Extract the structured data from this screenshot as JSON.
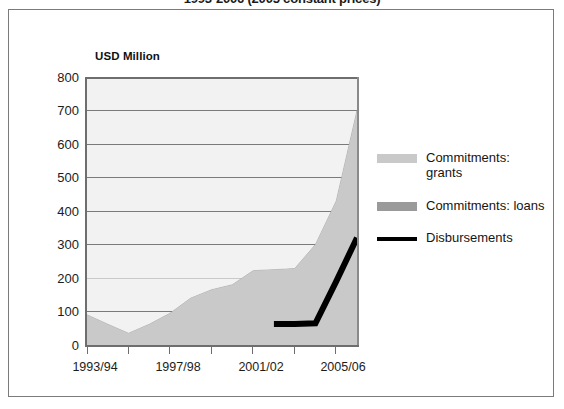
{
  "title": "1993-2006 (2005 constant prices)",
  "axis_unit_label": "USD Million",
  "legend": {
    "items": [
      {
        "label": "Commitments: grants",
        "color": "#c9c9c9",
        "type": "area",
        "swatch_name": "legend-swatch-grants"
      },
      {
        "label": "Commitments: loans",
        "color": "#9a9a9a",
        "type": "area",
        "swatch_name": "legend-swatch-loans"
      },
      {
        "label": "Disbursements",
        "color": "#000000",
        "type": "line",
        "swatch_name": "legend-swatch-disbursements"
      }
    ]
  },
  "chart_data": {
    "type": "area",
    "title": "1993-2006 (2005 constant prices)",
    "subtitle": "",
    "xlabel": "",
    "ylabel": "USD Million",
    "ylim": [
      0,
      800
    ],
    "ytick_values": [
      0,
      100,
      200,
      300,
      400,
      500,
      600,
      700,
      800
    ],
    "ytick_labels": [
      "0",
      "100",
      "200",
      "300",
      "400",
      "500",
      "600",
      "700",
      "800"
    ],
    "grid": true,
    "legend_position": "right",
    "stacked": true,
    "x": [
      "1993/94",
      "1994/95",
      "1995/96",
      "1996/97",
      "1997/98",
      "1998/99",
      "1999/00",
      "2000/01",
      "2001/02",
      "2002/03",
      "2003/04",
      "2004/05",
      "2005/06",
      "2006/07"
    ],
    "xtick_labels": [
      "1993/94",
      "1997/98",
      "2001/02",
      "2005/06"
    ],
    "xtick_label_indices": [
      0,
      4,
      8,
      12
    ],
    "series": [
      {
        "name": "Commitments: grants",
        "type": "area",
        "color": "#c9c9c9",
        "values": [
          90,
          62,
          35,
          62,
          95,
          140,
          165,
          180,
          222,
          225,
          228,
          300,
          430,
          700
        ]
      },
      {
        "name": "Commitments: loans",
        "type": "area",
        "color": "#9a9a9a",
        "values": [
          0,
          0,
          0,
          0,
          0,
          0,
          0,
          0,
          0,
          0,
          0,
          0,
          0,
          0
        ]
      },
      {
        "name": "Disbursements",
        "type": "line",
        "color": "#000000",
        "x": [
          "2002/03",
          "2003/04",
          "2004/05",
          "2005/06",
          "2006/07"
        ],
        "values": [
          63,
          63,
          65,
          190,
          320
        ]
      }
    ],
    "annotations": []
  }
}
